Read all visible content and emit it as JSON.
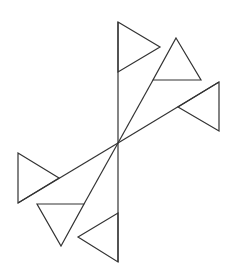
{
  "diagram": {
    "stroke_color": "#333333",
    "background": "#ffffff",
    "center": [
      118,
      143
    ],
    "lines": [
      {
        "name": "vertical-axis",
        "from": [
          118,
          22
        ],
        "to": [
          118,
          262
        ]
      },
      {
        "name": "ray-upper-right-steep",
        "from": [
          118,
          143
        ],
        "to": [
          153,
          80
        ]
      },
      {
        "name": "ray-upper-right-shallow",
        "from": [
          118,
          143
        ],
        "to": [
          219,
          82
        ]
      },
      {
        "name": "ray-lower-left-shallow",
        "from": [
          118,
          143
        ],
        "to": [
          18,
          203
        ]
      },
      {
        "name": "ray-lower-left-steep",
        "from": [
          118,
          143
        ],
        "to": [
          84,
          204
        ]
      }
    ],
    "triangles": [
      {
        "name": "triangle-top",
        "points": [
          [
            118,
            22
          ],
          [
            160,
            47
          ],
          [
            118,
            72
          ]
        ]
      },
      {
        "name": "triangle-upper-right",
        "points": [
          [
            176,
            38
          ],
          [
            201,
            80
          ],
          [
            153,
            80
          ]
        ]
      },
      {
        "name": "triangle-right",
        "points": [
          [
            219,
            82
          ],
          [
            219,
            131
          ],
          [
            178,
            107
          ]
        ]
      },
      {
        "name": "triangle-left",
        "points": [
          [
            18,
            153
          ],
          [
            59,
            178
          ],
          [
            18,
            203
          ]
        ]
      },
      {
        "name": "triangle-lower-left",
        "points": [
          [
            37,
            204
          ],
          [
            84,
            204
          ],
          [
            61,
            246
          ]
        ]
      },
      {
        "name": "triangle-bottom",
        "points": [
          [
            118,
            213
          ],
          [
            118,
            262
          ],
          [
            78,
            237
          ]
        ]
      }
    ]
  }
}
